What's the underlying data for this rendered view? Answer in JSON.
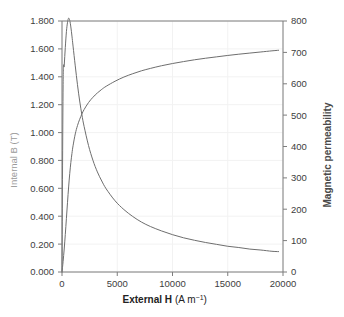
{
  "chart_data": {
    "type": "line",
    "title": "",
    "xlabel": "External H (A m⁻¹)",
    "xlabel_bold_part": "External H",
    "xlabel_units_part": "(A m",
    "xlabel_units_exponent": "−1",
    "xlabel_units_close": ")",
    "ylabel_left": "Internal B (T)",
    "ylabel_right": "Magnetic permeability",
    "xlim": [
      0,
      20000
    ],
    "ylim_left": [
      0.0,
      1.8
    ],
    "ylim_right": [
      0,
      800
    ],
    "grid": true,
    "legend": "none",
    "xticks": [
      0,
      5000,
      10000,
      15000,
      20000
    ],
    "xtick_labels": [
      "0",
      "5000",
      "10000",
      "15000",
      "20000"
    ],
    "yticks_left": [
      0.0,
      0.2,
      0.4,
      0.6,
      0.8,
      1.0,
      1.2,
      1.4,
      1.6,
      1.8
    ],
    "ytick_labels_left": [
      "0.000",
      "0.200",
      "0.400",
      "0.600",
      "0.800",
      "1.000",
      "1.200",
      "1.400",
      "1.600",
      "1.800"
    ],
    "yticks_right": [
      0,
      100,
      200,
      300,
      400,
      500,
      600,
      700,
      800
    ],
    "ytick_labels_right": [
      "0",
      "100",
      "200",
      "300",
      "400",
      "500",
      "600",
      "700",
      "800"
    ],
    "series": [
      {
        "name": "Internal B (T)",
        "axis": "left",
        "color": "#6e6e6e",
        "x": [
          0,
          100,
          200,
          300,
          400,
          500,
          600,
          700,
          800,
          900,
          1000,
          1200,
          1400,
          1600,
          1800,
          2000,
          2400,
          2800,
          3200,
          3600,
          4000,
          4800,
          5600,
          6400,
          7200,
          8000,
          9000,
          10000,
          11000,
          12000,
          13000,
          14000,
          15000,
          16000,
          17000,
          18000,
          19000,
          19600
        ],
        "values": [
          0.0,
          0.075,
          0.165,
          0.27,
          0.385,
          0.5,
          0.61,
          0.705,
          0.785,
          0.85,
          0.905,
          0.99,
          1.05,
          1.095,
          1.133,
          1.165,
          1.215,
          1.253,
          1.284,
          1.31,
          1.332,
          1.368,
          1.398,
          1.422,
          1.443,
          1.46,
          1.479,
          1.495,
          1.509,
          1.522,
          1.533,
          1.543,
          1.553,
          1.562,
          1.57,
          1.578,
          1.586,
          1.59
        ]
      },
      {
        "name": "Magnetic permeability",
        "axis": "right",
        "color": "#6e6e6e",
        "x": [
          0,
          100,
          200,
          300,
          400,
          500,
          600,
          700,
          800,
          900,
          1000,
          1200,
          1400,
          1600,
          1800,
          2000,
          2400,
          2800,
          3200,
          3600,
          4000,
          4800,
          5600,
          6400,
          7200,
          8000,
          9000,
          10000,
          11000,
          12000,
          13000,
          14000,
          15000,
          16000,
          17000,
          18000,
          19000,
          19600
        ],
        "values": [
          0,
          597,
          657,
          716,
          766,
          796,
          809,
          802,
          781,
          752,
          720,
          657,
          597,
          545,
          501,
          464,
          403,
          356,
          319,
          290,
          265,
          227,
          199,
          177,
          159,
          145,
          131,
          119,
          109,
          101,
          94,
          88,
          82,
          78,
          73,
          70,
          66,
          65
        ]
      }
    ],
    "annotations": []
  }
}
